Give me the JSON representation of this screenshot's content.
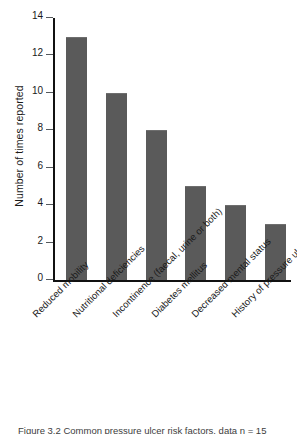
{
  "chart_data": {
    "type": "bar",
    "title": "",
    "xlabel": "",
    "ylabel": "Number of times reported",
    "categories": [
      "Reduced mobility",
      "Nutritional deficiencies",
      "Incontinence (faecal, urine or both)",
      "Diabetes mellitus",
      "Decreased mental status",
      "History of pressure ulcers"
    ],
    "values": [
      13,
      10,
      8,
      5,
      4,
      3
    ],
    "ylim": [
      0,
      14
    ],
    "yticks": [
      0,
      2,
      4,
      6,
      8,
      10,
      12,
      14
    ],
    "ytick_labels": [
      "0",
      "2",
      "4",
      "6",
      "8",
      "10",
      "12",
      "14"
    ],
    "grid": false,
    "legend": "none",
    "bar_color": "#5a5a5a",
    "axis_color": "#111111",
    "label_rotation_deg": -45
  },
  "figure": {
    "caption": "Figure 3.2   Common pressure ulcer risk factors, data n = 15",
    "background": "#ffffff"
  }
}
